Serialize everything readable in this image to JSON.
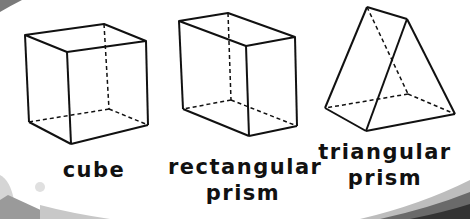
{
  "shapes": [
    {
      "name": "cube",
      "label_lines": [
        "cube"
      ]
    },
    {
      "name": "rectangular-prism",
      "label_lines": [
        "rectangular",
        "prism"
      ]
    },
    {
      "name": "triangular-prism",
      "label_lines": [
        "triangular",
        "prism"
      ]
    }
  ],
  "colors": {
    "line": "#111111",
    "background": "#ffffff",
    "swoosh_dark": "#4a4a4a",
    "swoosh_light": "#bdbdbd"
  }
}
